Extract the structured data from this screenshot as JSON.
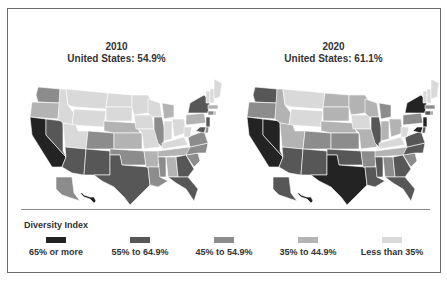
{
  "maps": [
    {
      "year": "2010",
      "summary": "United States: 54.9%",
      "states": {
        "WA": 2,
        "OR": 3,
        "CA": 0,
        "NV": 1,
        "ID": 4,
        "MT": 4,
        "WY": 4,
        "UT": 4,
        "AZ": 1,
        "CO": 2,
        "NM": 1,
        "ND": 4,
        "SD": 4,
        "NE": 3,
        "KS": 3,
        "OK": 2,
        "TX": 1,
        "MN": 4,
        "IA": 4,
        "MO": 4,
        "AR": 3,
        "LA": 2,
        "WI": 4,
        "IL": 2,
        "MI": 3,
        "IN": 4,
        "OH": 4,
        "KY": 4,
        "TN": 3,
        "MS": 2,
        "AL": 3,
        "GA": 1,
        "FL": 1,
        "SC": 2,
        "NC": 2,
        "VA": 2,
        "WV": 4,
        "PA": 3,
        "NY": 1,
        "NJ": 1,
        "MD": 1,
        "DE": 2,
        "CT": 2,
        "RI": 3,
        "MA": 3,
        "VT": 4,
        "NH": 4,
        "ME": 4,
        "AK": 2,
        "HI": 0
      }
    },
    {
      "year": "2020",
      "summary": "United States: 61.1%",
      "states": {
        "WA": 1,
        "OR": 2,
        "CA": 0,
        "NV": 0,
        "ID": 3,
        "MT": 4,
        "WY": 4,
        "UT": 3,
        "AZ": 1,
        "CO": 2,
        "NM": 1,
        "ND": 3,
        "SD": 3,
        "NE": 3,
        "KS": 2,
        "OK": 1,
        "TX": 0,
        "MN": 3,
        "IA": 4,
        "MO": 3,
        "AR": 2,
        "LA": 1,
        "WI": 3,
        "IL": 1,
        "MI": 2,
        "IN": 3,
        "OH": 3,
        "KY": 4,
        "TN": 3,
        "MS": 1,
        "AL": 2,
        "GA": 1,
        "FL": 1,
        "SC": 2,
        "NC": 1,
        "VA": 1,
        "WV": 4,
        "PA": 2,
        "NY": 0,
        "NJ": 0,
        "MD": 0,
        "DE": 1,
        "CT": 1,
        "RI": 2,
        "MA": 2,
        "VT": 4,
        "NH": 4,
        "ME": 4,
        "AK": 1,
        "HI": 0
      }
    }
  ],
  "legend": {
    "title": "Diversity Index",
    "items": [
      {
        "label": "65% or more",
        "color": "#232323"
      },
      {
        "label": "55% to 64.9%",
        "color": "#575757"
      },
      {
        "label": "45% to 54.9%",
        "color": "#8c8c8c"
      },
      {
        "label": "35% to 44.9%",
        "color": "#b3b3b3"
      },
      {
        "label": "Less than 35%",
        "color": "#d9d9d9"
      }
    ]
  }
}
